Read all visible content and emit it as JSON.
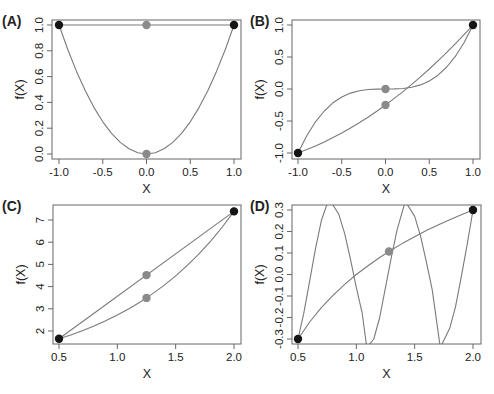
{
  "figure": {
    "colors": {
      "curve": "#7a7a7a",
      "axis": "#666666",
      "endpoint": "#151515",
      "midpoint": "#8a8a8a",
      "text": "#222222"
    }
  },
  "chart_data": [
    {
      "panel": "(A)",
      "type": "line",
      "title": "",
      "xlabel": "X",
      "ylabel": "f(X)",
      "xlim": [
        -1.0,
        1.0
      ],
      "ylim": [
        0.0,
        1.0
      ],
      "xticks": [
        -1.0,
        -0.5,
        0.0,
        0.5,
        1.0
      ],
      "xtick_labels": [
        "-1.0",
        "-0.5",
        "0.0",
        "0.5",
        "1.0"
      ],
      "yticks": [
        0.0,
        0.2,
        0.4,
        0.6,
        0.8,
        1.0
      ],
      "ytick_labels": [
        "0.0",
        "0.2",
        "0.4",
        "0.6",
        "0.8",
        "1.0"
      ],
      "grid": false,
      "series": [
        {
          "name": "f(X) = X^2",
          "x": [
            -1.0,
            -0.9,
            -0.8,
            -0.7,
            -0.6,
            -0.5,
            -0.4,
            -0.3,
            -0.2,
            -0.1,
            0.0,
            0.1,
            0.2,
            0.3,
            0.4,
            0.5,
            0.6,
            0.7,
            0.8,
            0.9,
            1.0
          ],
          "y": [
            1.0,
            0.81,
            0.64,
            0.49,
            0.36,
            0.25,
            0.16,
            0.09,
            0.04,
            0.01,
            0.0,
            0.01,
            0.04,
            0.09,
            0.16,
            0.25,
            0.36,
            0.49,
            0.64,
            0.81,
            1.0
          ]
        },
        {
          "name": "chord",
          "x": [
            -1.0,
            1.0
          ],
          "y": [
            1.0,
            1.0
          ]
        }
      ],
      "endpoints": [
        {
          "x": -1.0,
          "y": 1.0
        },
        {
          "x": 1.0,
          "y": 1.0
        }
      ],
      "midpoints": [
        {
          "x": 0.0,
          "y": 1.0
        },
        {
          "x": 0.0,
          "y": 0.0
        }
      ]
    },
    {
      "panel": "(B)",
      "type": "line",
      "title": "",
      "xlabel": "X",
      "ylabel": "f(X)",
      "xlim": [
        -1.0,
        1.0
      ],
      "ylim": [
        -1.0,
        1.0
      ],
      "xticks": [
        -1.0,
        -0.5,
        0.0,
        0.5,
        1.0
      ],
      "xtick_labels": [
        "-1.0",
        "-0.5",
        "0.0",
        "0.5",
        "1.0"
      ],
      "yticks": [
        -1.0,
        -0.5,
        0.0,
        0.5,
        1.0
      ],
      "ytick_labels": [
        "-1.0",
        "-0.5",
        "0.0",
        "0.5",
        "1.0"
      ],
      "grid": false,
      "series": [
        {
          "name": "f(X) = X^3",
          "x": [
            -1.0,
            -0.9,
            -0.8,
            -0.7,
            -0.6,
            -0.5,
            -0.4,
            -0.3,
            -0.2,
            -0.1,
            0.0,
            0.1,
            0.2,
            0.3,
            0.4,
            0.5,
            0.6,
            0.7,
            0.8,
            0.9,
            1.0
          ],
          "y": [
            -1.0,
            -0.729,
            -0.512,
            -0.343,
            -0.216,
            -0.125,
            -0.064,
            -0.027,
            -0.008,
            -0.001,
            0.0,
            0.001,
            0.008,
            0.027,
            0.064,
            0.125,
            0.216,
            0.343,
            0.512,
            0.729,
            1.0
          ]
        },
        {
          "name": "approximation",
          "x": [
            -1.0,
            -0.9,
            -0.8,
            -0.7,
            -0.6,
            -0.5,
            -0.4,
            -0.3,
            -0.2,
            -0.1,
            0.0,
            0.1,
            0.2,
            0.3,
            0.4,
            0.5,
            0.6,
            0.7,
            0.8,
            0.9,
            1.0
          ],
          "y": [
            -1.0,
            -0.9475,
            -0.89,
            -0.8275,
            -0.76,
            -0.6875,
            -0.61,
            -0.5275,
            -0.44,
            -0.3475,
            -0.25,
            -0.1475,
            -0.04,
            0.0725,
            0.19,
            0.3125,
            0.44,
            0.5725,
            0.71,
            0.8525,
            1.0
          ]
        }
      ],
      "endpoints": [
        {
          "x": -1.0,
          "y": -1.0
        },
        {
          "x": 1.0,
          "y": 1.0
        }
      ],
      "midpoints": [
        {
          "x": 0.0,
          "y": 0.0
        },
        {
          "x": 0.0,
          "y": -0.25
        }
      ]
    },
    {
      "panel": "(C)",
      "type": "line",
      "title": "",
      "xlabel": "X",
      "ylabel": "f(X)",
      "xlim": [
        0.5,
        2.0
      ],
      "ylim": [
        1.5,
        7.6
      ],
      "xticks": [
        0.5,
        1.0,
        1.5,
        2.0
      ],
      "xtick_labels": [
        "0.5",
        "1.0",
        "1.5",
        "2.0"
      ],
      "yticks": [
        2,
        3,
        4,
        5,
        6,
        7
      ],
      "ytick_labels": [
        "2",
        "3",
        "4",
        "5",
        "6",
        "7"
      ],
      "grid": false,
      "series": [
        {
          "name": "f(X) = exp(X)",
          "x": [
            0.5,
            0.6,
            0.7,
            0.8,
            0.9,
            1.0,
            1.1,
            1.2,
            1.25,
            1.3,
            1.4,
            1.5,
            1.6,
            1.7,
            1.8,
            1.9,
            2.0
          ],
          "y": [
            1.649,
            1.822,
            2.014,
            2.226,
            2.46,
            2.718,
            3.004,
            3.32,
            3.49,
            3.669,
            4.055,
            4.482,
            4.953,
            5.474,
            6.05,
            6.686,
            7.389
          ]
        },
        {
          "name": "chord",
          "x": [
            0.5,
            2.0
          ],
          "y": [
            1.649,
            7.389
          ]
        }
      ],
      "endpoints": [
        {
          "x": 0.5,
          "y": 1.649
        },
        {
          "x": 2.0,
          "y": 7.389
        }
      ],
      "midpoints": [
        {
          "x": 1.25,
          "y": 4.519
        },
        {
          "x": 1.25,
          "y": 3.49
        }
      ]
    },
    {
      "panel": "(D)",
      "type": "line",
      "title": "",
      "xlabel": "X",
      "ylabel": "f(X)",
      "xlim": [
        0.5,
        2.0
      ],
      "ylim": [
        -0.3,
        0.3
      ],
      "xticks": [
        0.5,
        1.0,
        1.5,
        2.0
      ],
      "xtick_labels": [
        "0.5",
        "1.0",
        "1.5",
        "2.0"
      ],
      "yticks": [
        -0.3,
        -0.2,
        -0.1,
        0.0,
        0.1,
        0.2,
        0.3
      ],
      "ytick_labels": [
        "-0.3",
        "-0.2",
        "-0.1",
        "0.0",
        "0.1",
        "0.2",
        "0.3"
      ],
      "grid": false,
      "series": [
        {
          "name": "log curve",
          "x": [
            0.5,
            0.6,
            0.7,
            0.8,
            0.9,
            1.0,
            1.1,
            1.2,
            1.3,
            1.4,
            1.5,
            1.6,
            1.7,
            1.8,
            1.9,
            2.0
          ],
          "y": [
            -0.3,
            -0.221,
            -0.154,
            -0.097,
            -0.046,
            0.0,
            0.041,
            0.079,
            0.114,
            0.146,
            0.176,
            0.204,
            0.23,
            0.255,
            0.278,
            0.3
          ]
        },
        {
          "name": "oscillating curve",
          "x": [
            0.5,
            0.55,
            0.6,
            0.65,
            0.7,
            0.75,
            0.78,
            0.85,
            0.9,
            0.95,
            1.0,
            1.05,
            1.09,
            1.15,
            1.2,
            1.25,
            1.3,
            1.35,
            1.42,
            1.5,
            1.55,
            1.6,
            1.65,
            1.72,
            1.8,
            1.85,
            1.9,
            1.95,
            2.0
          ],
          "y": [
            -0.3,
            -0.18,
            -0.03,
            0.12,
            0.25,
            0.33,
            0.34,
            0.28,
            0.19,
            0.07,
            -0.06,
            -0.18,
            -0.34,
            -0.3,
            -0.2,
            -0.06,
            0.08,
            0.21,
            0.34,
            0.27,
            0.18,
            0.06,
            -0.07,
            -0.34,
            -0.25,
            -0.15,
            -0.01,
            0.14,
            0.3
          ]
        }
      ],
      "endpoints": [
        {
          "x": 0.5,
          "y": -0.3
        },
        {
          "x": 2.0,
          "y": 0.3
        }
      ],
      "midpoints": [
        {
          "x": 1.28,
          "y": 0.107
        }
      ]
    }
  ]
}
